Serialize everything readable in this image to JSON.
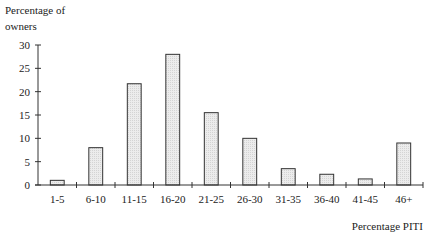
{
  "chart_data": {
    "type": "bar",
    "title": "",
    "ylabel": "Percentage of owners",
    "ylabel_lines": [
      "Percentage of",
      "owners"
    ],
    "xlabel": "Percentage PITI",
    "categories": [
      "1-5",
      "6-10",
      "11-15",
      "16-20",
      "21-25",
      "26-30",
      "31-35",
      "36-40",
      "41-45",
      "46+"
    ],
    "values": [
      1,
      8,
      21.7,
      28,
      15.5,
      10,
      3.5,
      2.3,
      1.3,
      9
    ],
    "ylim": [
      0,
      30
    ],
    "yticks": [
      0,
      5,
      10,
      15,
      20,
      25,
      30
    ],
    "grid": false,
    "legend": "none",
    "bar_fill": "#e6e6e6",
    "bar_stroke": "#333333",
    "axis_color": "#333333"
  }
}
